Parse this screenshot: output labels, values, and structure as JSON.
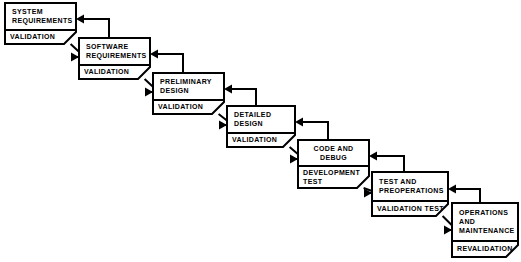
{
  "diagram": {
    "type": "waterfall-flow",
    "background_color": "#ffffff",
    "line_color": "#000000",
    "stages": [
      {
        "id": "system-requirements",
        "title_lines": [
          "SYSTEM",
          "REQUIREMENTS"
        ],
        "title_align": "left",
        "sub_lines": [
          "VALIDATION"
        ],
        "sub_align": "left",
        "x": 5,
        "y": 3,
        "w": 71,
        "h": 41,
        "divider_y": 27,
        "clip": 12
      },
      {
        "id": "software-requirements",
        "title_lines": [
          "SOFTWARE",
          "REQUIREMENTS"
        ],
        "title_align": "left",
        "sub_lines": [
          "VALIDATION"
        ],
        "sub_align": "left",
        "x": 79,
        "y": 38,
        "w": 71,
        "h": 41,
        "divider_y": 27,
        "clip": 12
      },
      {
        "id": "preliminary-design",
        "title_lines": [
          "PRELIMINARY",
          "DESIGN"
        ],
        "title_align": "left",
        "sub_lines": [
          "VALIDATION"
        ],
        "sub_align": "left",
        "x": 153,
        "y": 73,
        "w": 71,
        "h": 41,
        "divider_y": 27,
        "clip": 12
      },
      {
        "id": "detailed-design",
        "title_lines": [
          "DETAILED",
          "DESIGN"
        ],
        "title_align": "left",
        "sub_lines": [
          "VALIDATION"
        ],
        "sub_align": "left",
        "x": 227,
        "y": 106,
        "w": 68,
        "h": 41,
        "divider_y": 27,
        "clip": 12
      },
      {
        "id": "code-and-debug",
        "title_lines": [
          "CODE AND",
          "DEBUG"
        ],
        "title_align": "center",
        "sub_lines": [
          "DEVELOPMENT",
          "TEST"
        ],
        "sub_align": "left",
        "x": 298,
        "y": 140,
        "w": 71,
        "h": 48,
        "divider_y": 26,
        "clip": 12
      },
      {
        "id": "test-and-preoperations",
        "title_lines": [
          "TEST AND",
          "PREOPERATIONS"
        ],
        "title_align": "left",
        "sub_lines": [
          "VALIDATION TEST"
        ],
        "sub_align": "left",
        "x": 372,
        "y": 172,
        "w": 76,
        "h": 44,
        "divider_y": 29,
        "clip": 12
      },
      {
        "id": "operations-and-maintenance",
        "title_lines": [
          "OPERATIONS",
          "AND",
          "MAINTENANCE"
        ],
        "title_align": "left",
        "sub_lines": [
          "REVALIDATION"
        ],
        "sub_align": "left",
        "x": 452,
        "y": 203,
        "w": 66,
        "h": 54,
        "divider_y": 38,
        "clip": 12
      }
    ],
    "forward_connections": [
      {
        "id": "fwd-system-to-software",
        "from": "system-requirements",
        "to": "software-requirements"
      },
      {
        "id": "fwd-software-to-preliminary",
        "from": "software-requirements",
        "to": "preliminary-design"
      },
      {
        "id": "fwd-preliminary-to-detailed",
        "from": "preliminary-design",
        "to": "detailed-design"
      },
      {
        "id": "fwd-detailed-to-code",
        "from": "detailed-design",
        "to": "code-and-debug"
      },
      {
        "id": "fwd-code-to-test",
        "from": "code-and-debug",
        "to": "test-and-preoperations"
      },
      {
        "id": "fwd-test-to-operations",
        "from": "test-and-preoperations",
        "to": "operations-and-maintenance"
      }
    ],
    "feedback_connections": [
      {
        "id": "fb-software-to-system",
        "from": "software-requirements",
        "to": "system-requirements"
      },
      {
        "id": "fb-preliminary-to-software",
        "from": "preliminary-design",
        "to": "software-requirements"
      },
      {
        "id": "fb-detailed-to-preliminary",
        "from": "detailed-design",
        "to": "preliminary-design"
      },
      {
        "id": "fb-code-to-detailed",
        "from": "code-and-debug",
        "to": "detailed-design"
      },
      {
        "id": "fb-test-to-code",
        "from": "test-and-preoperations",
        "to": "code-and-debug"
      },
      {
        "id": "fb-operations-to-test",
        "from": "operations-and-maintenance",
        "to": "test-and-preoperations"
      }
    ]
  }
}
